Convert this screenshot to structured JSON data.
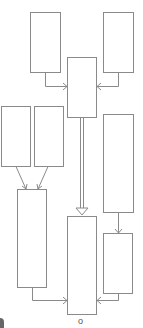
{
  "diagram": {
    "type": "flowchart",
    "colors": {
      "stroke": "#8a8a8a",
      "fill": "#ffffff",
      "background": "#ffffff"
    },
    "nodes": [
      {
        "id": "top-left",
        "x": 30,
        "y": 12,
        "w": 30,
        "h": 60,
        "label": ""
      },
      {
        "id": "top-right",
        "x": 103,
        "y": 12,
        "w": 30,
        "h": 60,
        "label": ""
      },
      {
        "id": "center-upper",
        "x": 67,
        "y": 57,
        "w": 29,
        "h": 60,
        "label": ""
      },
      {
        "id": "mid-left-a",
        "x": 1,
        "y": 106,
        "w": 29,
        "h": 60,
        "label": ""
      },
      {
        "id": "mid-left-b",
        "x": 34,
        "y": 106,
        "w": 29,
        "h": 60,
        "label": ""
      },
      {
        "id": "right-tall",
        "x": 103,
        "y": 114,
        "w": 30,
        "h": 98,
        "label": ""
      },
      {
        "id": "left-tall",
        "x": 17,
        "y": 189,
        "w": 29,
        "h": 98,
        "label": ""
      },
      {
        "id": "center-lower",
        "x": 67,
        "y": 216,
        "w": 29,
        "h": 98,
        "label": ""
      },
      {
        "id": "right-small",
        "x": 103,
        "y": 233,
        "w": 29,
        "h": 60,
        "label": ""
      }
    ],
    "edges": [
      {
        "from": "top-left",
        "to": "center-upper",
        "style": "elbow"
      },
      {
        "from": "top-right",
        "to": "center-upper",
        "style": "elbow"
      },
      {
        "from": "mid-left-a",
        "to": "left-tall",
        "style": "diagonal"
      },
      {
        "from": "mid-left-b",
        "to": "left-tall",
        "style": "diagonal"
      },
      {
        "from": "center-upper",
        "to": "center-lower",
        "style": "hollow-double"
      },
      {
        "from": "right-tall",
        "to": "right-small",
        "style": "straight"
      },
      {
        "from": "left-tall",
        "to": "center-lower",
        "style": "elbow"
      },
      {
        "from": "right-small",
        "to": "center-lower",
        "style": "elbow"
      }
    ],
    "footer_mark": "o"
  }
}
